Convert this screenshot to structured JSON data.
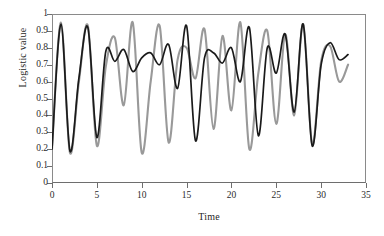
{
  "chart_data": {
    "type": "line",
    "title": "",
    "xlabel": "Time",
    "ylabel": "Logistic value",
    "xlim": [
      0,
      35
    ],
    "ylim": [
      0,
      1
    ],
    "xticks": [
      0,
      5,
      10,
      15,
      20,
      25,
      30,
      35
    ],
    "xtick_labels": [
      "0",
      "5",
      "10",
      "15",
      "20",
      "25",
      "30",
      "35"
    ],
    "yticks": [
      0,
      0.1,
      0.2,
      0.3,
      0.4,
      0.5,
      0.6,
      0.7,
      0.8,
      0.9,
      1
    ],
    "ytick_labels": [
      "0",
      "0.1",
      "0.2",
      "0.3",
      "0.4",
      "0.5",
      "0.6",
      "0.7",
      "0.8",
      "0.9",
      "1"
    ],
    "grid": false,
    "legend": null,
    "legend_position": "none",
    "annotations": [],
    "colors": {
      "series_1": "#999999",
      "series_2": "#1a1a1a",
      "axis": "#7a7a7a",
      "text": "#222222",
      "background": "#ffffff"
    },
    "x": [
      0,
      1,
      2,
      3,
      4,
      5,
      6,
      7,
      8,
      9,
      10,
      11,
      12,
      13,
      14,
      15,
      16,
      17,
      18,
      19,
      20,
      21,
      22,
      23,
      24,
      25,
      26,
      27,
      28,
      29,
      30,
      31,
      32,
      33
    ],
    "series": [
      {
        "name": "series_1",
        "color": "#999999",
        "label": "Trajectory A",
        "values": [
          0.2,
          0.95,
          0.18,
          0.6,
          0.93,
          0.22,
          0.69,
          0.86,
          0.46,
          0.95,
          0.18,
          0.6,
          0.93,
          0.24,
          0.73,
          0.8,
          0.62,
          0.91,
          0.32,
          0.87,
          0.43,
          0.95,
          0.2,
          0.65,
          0.9,
          0.35,
          0.88,
          0.4,
          0.94,
          0.23,
          0.72,
          0.81,
          0.6,
          0.7
        ]
      },
      {
        "name": "series_2",
        "color": "#1a1a1a",
        "label": "Trajectory B",
        "values": [
          0.2,
          0.94,
          0.19,
          0.62,
          0.92,
          0.27,
          0.78,
          0.72,
          0.79,
          0.66,
          0.74,
          0.77,
          0.7,
          0.82,
          0.56,
          0.93,
          0.25,
          0.74,
          0.77,
          0.71,
          0.8,
          0.6,
          0.92,
          0.28,
          0.8,
          0.65,
          0.88,
          0.42,
          0.94,
          0.22,
          0.7,
          0.83,
          0.73,
          0.76
        ]
      }
    ]
  },
  "axis": {
    "x_title": "Time",
    "y_title": "Logistic value"
  }
}
